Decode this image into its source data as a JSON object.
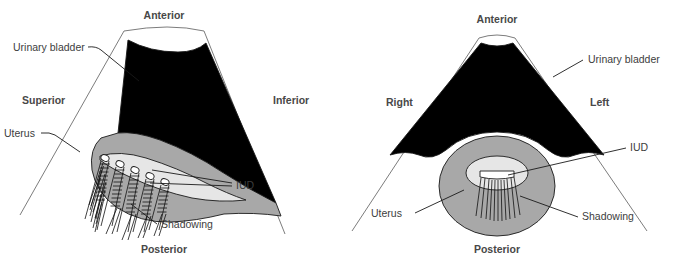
{
  "figure": {
    "background_color": "#ffffff",
    "colors": {
      "bladder_anechoic": "#000000",
      "uterus_gray": "#a8a8a8",
      "endometrium_light": "#e6e6e6",
      "outline": "#1a1a1a",
      "fan_line": "#6d6d6d",
      "label_text": "#3d3d3d"
    }
  },
  "panels": [
    {
      "id": "sagittal",
      "plane": "sagittal",
      "orientation_labels": {
        "top": "Anterior",
        "left": "Superior",
        "right": "Inferior",
        "bottom": "Posterior"
      },
      "annotations": [
        {
          "name": "urinary-bladder",
          "label": "Urinary bladder",
          "side": "left"
        },
        {
          "name": "uterus",
          "label": "Uterus",
          "side": "left"
        },
        {
          "name": "iud",
          "label": "IUD",
          "side": "right"
        },
        {
          "name": "shadowing",
          "label": "Shadowing",
          "side": "bottom"
        }
      ],
      "iud_reflector_count": 5,
      "shadow_band_count": 5
    },
    {
      "id": "transverse",
      "plane": "transverse",
      "orientation_labels": {
        "top": "Anterior",
        "left": "Right",
        "right": "Left",
        "bottom": "Posterior"
      },
      "annotations": [
        {
          "name": "urinary-bladder",
          "label": "Urinary bladder",
          "side": "right"
        },
        {
          "name": "iud",
          "label": "IUD",
          "side": "right"
        },
        {
          "name": "uterus",
          "label": "Uterus",
          "side": "left"
        },
        {
          "name": "shadowing",
          "label": "Shadowing",
          "side": "right"
        }
      ],
      "iud_reflector_count": 1,
      "shadow_line_count": 11
    }
  ]
}
